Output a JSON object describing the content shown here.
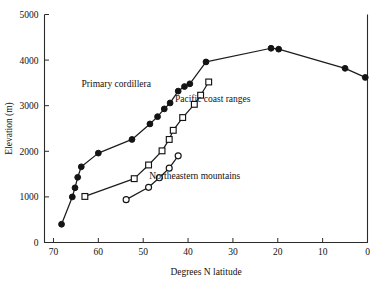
{
  "chart_data": {
    "type": "line",
    "title": "",
    "xlabel": "Degrees N latitude",
    "ylabel": "Elevation (m)",
    "xlim": [
      72,
      0
    ],
    "ylim": [
      0,
      5000
    ],
    "x_reversed": true,
    "grid": false,
    "legend_position": "inline-annotations",
    "xticks": [
      70,
      60,
      50,
      40,
      30,
      20,
      10,
      0
    ],
    "xtick_labels": [
      "70",
      "60",
      "50",
      "40",
      "30",
      "20",
      "10",
      "0"
    ],
    "yticks": [
      0,
      1000,
      2000,
      3000,
      4000,
      5000
    ],
    "ytick_labels": [
      "0",
      "1000",
      "2000",
      "3000",
      "4000",
      "5000"
    ],
    "series": [
      {
        "name": "Primary cordillera",
        "marker": "filled-circle",
        "x": [
          68.2,
          65.8,
          65.2,
          64.6,
          63.8,
          60.0,
          52.5,
          48.5,
          46.8,
          45.3,
          44.0,
          42.2,
          40.8,
          39.6,
          36.0,
          21.5,
          19.8,
          5.0,
          0.5
        ],
        "y": [
          400,
          1000,
          1200,
          1430,
          1660,
          1960,
          2260,
          2600,
          2760,
          2930,
          3060,
          3320,
          3420,
          3480,
          3960,
          4260,
          4240,
          3820,
          3620
        ]
      },
      {
        "name": "Pacific coast ranges",
        "marker": "open-square",
        "x": [
          63.0,
          52.0,
          48.8,
          45.8,
          44.2,
          43.3,
          41.2,
          38.6,
          37.2,
          35.4
        ],
        "y": [
          1010,
          1400,
          1700,
          2010,
          2260,
          2460,
          2740,
          3030,
          3230,
          3520
        ]
      },
      {
        "name": "Northeastern mountains",
        "marker": "open-circle",
        "x": [
          53.8,
          48.8,
          46.4,
          44.2,
          42.2
        ],
        "y": [
          940,
          1210,
          1420,
          1630,
          1900
        ]
      }
    ],
    "annotations": [
      {
        "text": "Primary cordillera",
        "x": 56.0,
        "y": 3420
      },
      {
        "text": "Pacific coast ranges",
        "x": 34.5,
        "y": 3080
      },
      {
        "text": "Northeastern mountains",
        "x": 38.5,
        "y": 1400
      }
    ]
  }
}
